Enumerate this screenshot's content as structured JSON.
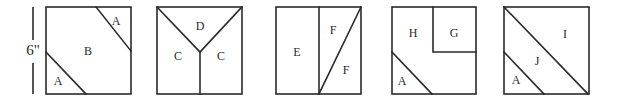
{
  "dimension": {
    "label": "6\""
  },
  "blocks": [
    {
      "id": "block-1",
      "pieces": [
        {
          "label": "A",
          "position": "top-right corner triangle"
        },
        {
          "label": "B",
          "position": "center band"
        },
        {
          "label": "A",
          "position": "bottom-left corner triangle"
        }
      ]
    },
    {
      "id": "block-2",
      "pieces": [
        {
          "label": "D",
          "position": "top triangle"
        },
        {
          "label": "C",
          "position": "left trapezoid"
        },
        {
          "label": "C",
          "position": "right trapezoid"
        }
      ]
    },
    {
      "id": "block-3",
      "pieces": [
        {
          "label": "E",
          "position": "left rectangle"
        },
        {
          "label": "F",
          "position": "right upper triangle"
        },
        {
          "label": "F",
          "position": "right lower triangle"
        }
      ]
    },
    {
      "id": "block-4",
      "pieces": [
        {
          "label": "H",
          "position": "L-shaped region"
        },
        {
          "label": "G",
          "position": "top-right square"
        },
        {
          "label": "A",
          "position": "bottom-left corner triangle"
        }
      ]
    },
    {
      "id": "block-5",
      "pieces": [
        {
          "label": "I",
          "position": "upper-right half triangle"
        },
        {
          "label": "J",
          "position": "middle band"
        },
        {
          "label": "A",
          "position": "bottom-left corner triangle"
        }
      ]
    }
  ]
}
